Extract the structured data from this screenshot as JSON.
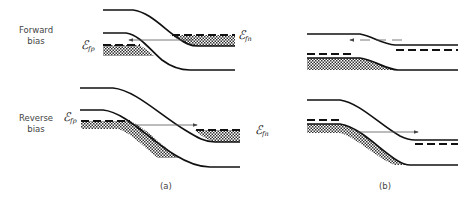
{
  "rows": {
    "forward": {
      "label_line1": "Forward",
      "label_line2": "bias"
    },
    "reverse": {
      "label_line1": "Reverse",
      "label_line2": "bias"
    }
  },
  "panels": {
    "a": {
      "label": "(a)"
    },
    "b": {
      "label": "(b)"
    }
  },
  "quasi_fermi_levels": {
    "p_side": {
      "symbol": "ℰ",
      "subscript": "fp"
    },
    "n_side": {
      "symbol": "ℰ",
      "subscript": "fn"
    }
  },
  "diagrams": [
    {
      "id": "forward-a",
      "row": "forward",
      "panel": "a",
      "tunneling_direction": "n-to-p",
      "arrow_style": "solid"
    },
    {
      "id": "forward-b",
      "row": "forward",
      "panel": "b",
      "tunneling_direction": "n-to-p",
      "arrow_style": "dashed"
    },
    {
      "id": "reverse-a",
      "row": "reverse",
      "panel": "a",
      "tunneling_direction": "p-to-n",
      "arrow_style": "solid"
    },
    {
      "id": "reverse-b",
      "row": "reverse",
      "panel": "b",
      "tunneling_direction": "p-to-n",
      "arrow_style": "solid"
    }
  ]
}
